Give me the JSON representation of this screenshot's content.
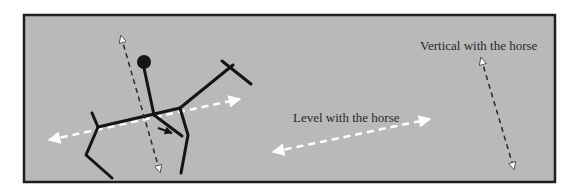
{
  "diagram": {
    "type": "rider-on-horse-stick-figure",
    "colors": {
      "background": "#ffffff",
      "panel_fill": "#b9b9b9",
      "panel_border": "#1e1e1e",
      "figure_stroke": "#141414",
      "level_arrow": "#ffffff",
      "vertical_arrow": "#2a2a2a"
    },
    "labels": {
      "level": "Level with the horse",
      "vertical": "Vertical with the horse"
    },
    "elements": [
      "stick-figure-horse",
      "rider-with-head",
      "vertical-dashed-arrow-through-rider",
      "level-dashed-arrow-along-horse-back",
      "level-with-horse-legend-arrow",
      "vertical-with-horse-legend-arrow"
    ]
  }
}
